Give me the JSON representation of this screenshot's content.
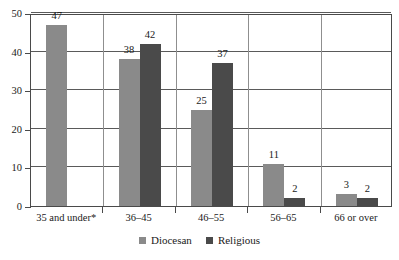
{
  "chart_data": {
    "type": "bar",
    "title": "",
    "xlabel": "",
    "ylabel": "",
    "categories": [
      "35 and under*",
      "36–45",
      "46–55",
      "56–65",
      "66 or over"
    ],
    "ylim": [
      0,
      50
    ],
    "yticks": [
      0,
      10,
      20,
      30,
      40,
      50
    ],
    "grid": true,
    "legend_position": "bottom-center",
    "series": [
      {
        "name": "Diocesan",
        "color": "#8a8a8a",
        "values": [
          47,
          38,
          25,
          11,
          3
        ],
        "labels": [
          "47",
          "38",
          "25",
          "11",
          "3"
        ]
      },
      {
        "name": "Religious",
        "color": "#4a4a4a",
        "values": [
          null,
          42,
          37,
          2,
          2
        ],
        "labels": [
          "",
          "42",
          "37",
          "2",
          "2"
        ]
      }
    ]
  },
  "axis": {
    "y_tick_labels": [
      "50",
      "40",
      "30",
      "20",
      "10",
      "0"
    ]
  },
  "legend": {
    "items": [
      {
        "label": "Diocesan",
        "color": "#8a8a8a"
      },
      {
        "label": "Religious",
        "color": "#4a4a4a"
      }
    ]
  },
  "colors": {
    "diocesan": "#8a8a8a",
    "religious": "#4a4a4a",
    "axis": "#4a4a4a",
    "gridline": "#5a5a5a",
    "background": "#ffffff",
    "text": "#1a1a1a"
  }
}
